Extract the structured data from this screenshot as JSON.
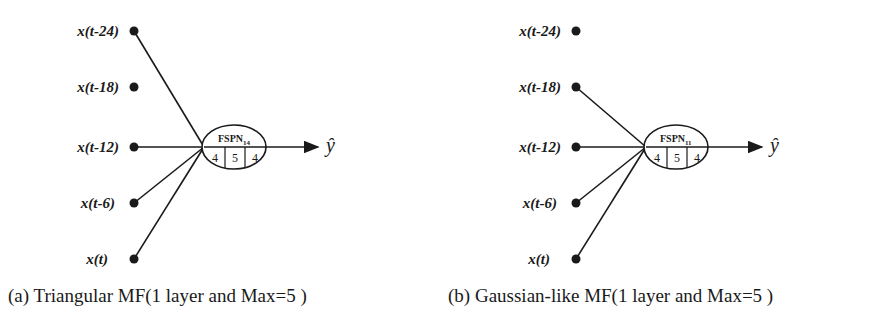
{
  "figure": {
    "panels": [
      {
        "id": "a",
        "caption": "(a) Triangular MF(1 layer and Max=5 )",
        "inputs": [
          {
            "label": "x(t-24)",
            "connected": true
          },
          {
            "label": "x(t-18)",
            "connected": false
          },
          {
            "label": "x(t-12)",
            "connected": true
          },
          {
            "label": "x(t-6)",
            "connected": true
          },
          {
            "label": "x(t)",
            "connected": true
          }
        ],
        "node": {
          "name": "FSPN",
          "subscript": "14",
          "cells": [
            "4",
            "5",
            "4"
          ]
        },
        "output": "ŷ"
      },
      {
        "id": "b",
        "caption": "(b) Gaussian-like MF(1 layer and Max=5 )",
        "inputs": [
          {
            "label": "x(t-24)",
            "connected": false
          },
          {
            "label": "x(t-18)",
            "connected": true
          },
          {
            "label": "x(t-12)",
            "connected": true
          },
          {
            "label": "x(t-6)",
            "connected": true
          },
          {
            "label": "x(t)",
            "connected": true
          }
        ],
        "node": {
          "name": "FSPN",
          "subscript": "11",
          "cells": [
            "4",
            "5",
            "4"
          ]
        },
        "output": "ŷ"
      }
    ],
    "colors": {
      "ink": "#1a1a1a",
      "background": "#ffffff"
    }
  }
}
